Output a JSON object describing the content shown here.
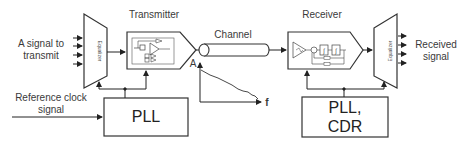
{
  "diagram": {
    "input_label": "A signal to transmit",
    "input_label_line1": "A signal to",
    "input_label_line2": "transmit",
    "reference_clock_line1": "Reference clock",
    "reference_clock_line2": "signal",
    "transmitter_title": "Transmitter",
    "channel_title": "Channel",
    "receiver_title": "Receiver",
    "left_equalizer_label": "Equalizer",
    "right_equalizer_label": "Equalizer",
    "pll_left_label": "PLL",
    "pll_right_line1": "PLL,",
    "pll_right_line2": "CDR",
    "output_label_line1": "Received",
    "output_label_line2": "signal",
    "graph_y_axis": "A",
    "graph_x_axis": "f"
  },
  "colors": {
    "stroke": "#333333",
    "text": "#3a3a3a",
    "background": "#ffffff"
  }
}
